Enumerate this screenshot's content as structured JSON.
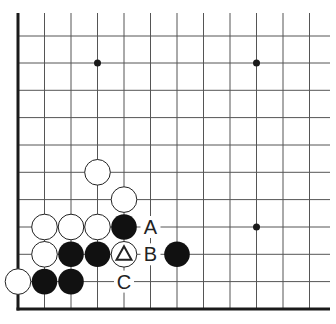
{
  "diagram": {
    "type": "go-board-corner",
    "corner": "bottom-left",
    "visible_columns": 12,
    "visible_rows": 11,
    "grid": {
      "x": [
        18,
        44.5,
        71,
        97.5,
        124,
        150.5,
        177,
        203.5,
        230,
        256.5,
        283,
        309.5
      ],
      "y": [
        36,
        63,
        90.3,
        117.6,
        145,
        172.3,
        199.6,
        227,
        254.3,
        281.6,
        309
      ],
      "left_edge_col": 0,
      "bottom_edge_row": 10
    },
    "star_points": [
      {
        "col": 3,
        "row": 1
      },
      {
        "col": 9,
        "row": 1
      },
      {
        "col": 9,
        "row": 7
      }
    ],
    "stones": [
      {
        "color": "white",
        "col": 3,
        "row": 5
      },
      {
        "color": "white",
        "col": 4,
        "row": 6
      },
      {
        "color": "white",
        "col": 1,
        "row": 7
      },
      {
        "color": "white",
        "col": 2,
        "row": 7
      },
      {
        "color": "white",
        "col": 3,
        "row": 7
      },
      {
        "color": "black",
        "col": 4,
        "row": 7
      },
      {
        "color": "white",
        "col": 1,
        "row": 8
      },
      {
        "color": "black",
        "col": 2,
        "row": 8
      },
      {
        "color": "black",
        "col": 3,
        "row": 8
      },
      {
        "color": "white",
        "col": 4,
        "row": 8,
        "marker": "triangle"
      },
      {
        "color": "black",
        "col": 6,
        "row": 8
      },
      {
        "color": "white",
        "col": 0,
        "row": 9
      },
      {
        "color": "black",
        "col": 1,
        "row": 9
      },
      {
        "color": "black",
        "col": 2,
        "row": 9
      }
    ],
    "labels": [
      {
        "text": "A",
        "col": 5,
        "row": 7
      },
      {
        "text": "B",
        "col": 5,
        "row": 8
      },
      {
        "text": "C",
        "col": 4,
        "row": 9
      }
    ],
    "colors": {
      "line": "#555555",
      "edge": "#1a1a1a",
      "black_stone": "#111111",
      "white_stone": "#ffffff",
      "stone_outline": "#222222",
      "label": "#222222"
    }
  }
}
